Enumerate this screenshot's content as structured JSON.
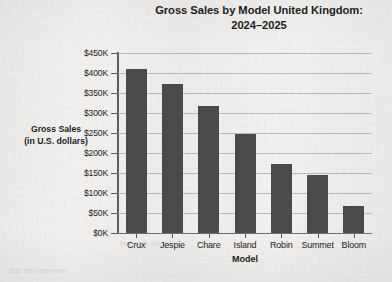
{
  "chart_data": {
    "type": "bar",
    "title": "Gross Sales by Model United Kingdom:",
    "title_line2": "2024–2025",
    "xlabel": "Model",
    "ylabel": "Gross Sales",
    "ylabel_line2": "(in U.S. dollars)",
    "categories": [
      "Crux",
      "Jespie",
      "Chare",
      "Island",
      "Robin",
      "Summet",
      "Bloom"
    ],
    "values": [
      410000,
      372000,
      317000,
      247000,
      172000,
      145000,
      67000
    ],
    "ylim": [
      0,
      450000
    ],
    "ytick_values": [
      0,
      50000,
      100000,
      150000,
      200000,
      250000,
      300000,
      350000,
      400000,
      450000
    ],
    "ytick_labels": [
      "$0K",
      "$50K",
      "$100K",
      "$150K",
      "$200K",
      "$250K",
      "$300K",
      "$350K",
      "$400K",
      "$450K"
    ],
    "grid": true,
    "legend": false,
    "bar_color": "#4a4a4a",
    "gridline_color": "#b7b7b7",
    "axis_color": "#5a5a5a",
    "background_color": "#f3f2f0"
  },
  "bleed_through": {
    "top": "reverse-side text",
    "bottom": "reverse-side text"
  }
}
